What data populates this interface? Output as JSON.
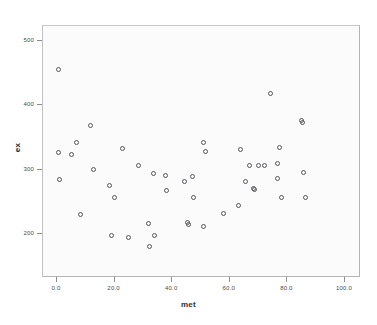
{
  "chart_data": {
    "type": "scatter",
    "title": "",
    "xlabel": "met",
    "ylabel": "ex",
    "xlim": [
      -5,
      105
    ],
    "ylim": [
      160,
      520
    ],
    "grid": false,
    "legend": null,
    "marker": "open-circle",
    "marker_color": "#55555c",
    "x_ticks": [
      0.0,
      20.0,
      40.0,
      60.0,
      80.0,
      100.0
    ],
    "x_tick_labels": [
      "0.0",
      "20.0",
      "40.0",
      "60.0",
      "80.0",
      "100.0"
    ],
    "y_ticks": [
      200,
      300,
      400,
      500
    ],
    "y_tick_labels": [
      "200",
      "300",
      "400",
      "500"
    ],
    "n_points": 55,
    "points": [
      {
        "x": 0.4,
        "y": 455
      },
      {
        "x": 0.6,
        "y": 327
      },
      {
        "x": 0.8,
        "y": 284
      },
      {
        "x": 5.2,
        "y": 323
      },
      {
        "x": 6.9,
        "y": 343
      },
      {
        "x": 8.0,
        "y": 230
      },
      {
        "x": 11.8,
        "y": 369
      },
      {
        "x": 12.5,
        "y": 301
      },
      {
        "x": 18.2,
        "y": 276
      },
      {
        "x": 18.9,
        "y": 198
      },
      {
        "x": 20.1,
        "y": 256
      },
      {
        "x": 22.9,
        "y": 333
      },
      {
        "x": 24.7,
        "y": 195
      },
      {
        "x": 28.3,
        "y": 307
      },
      {
        "x": 31.6,
        "y": 216
      },
      {
        "x": 32.0,
        "y": 181
      },
      {
        "x": 33.4,
        "y": 294
      },
      {
        "x": 34.0,
        "y": 197
      },
      {
        "x": 37.6,
        "y": 291
      },
      {
        "x": 37.9,
        "y": 268
      },
      {
        "x": 44.1,
        "y": 281
      },
      {
        "x": 45.3,
        "y": 218
      },
      {
        "x": 45.8,
        "y": 215
      },
      {
        "x": 46.9,
        "y": 289
      },
      {
        "x": 47.4,
        "y": 256
      },
      {
        "x": 50.7,
        "y": 212
      },
      {
        "x": 51.0,
        "y": 342
      },
      {
        "x": 51.6,
        "y": 328
      },
      {
        "x": 57.8,
        "y": 232
      },
      {
        "x": 62.9,
        "y": 245
      },
      {
        "x": 63.6,
        "y": 332
      },
      {
        "x": 65.5,
        "y": 282
      },
      {
        "x": 66.9,
        "y": 306
      },
      {
        "x": 68.3,
        "y": 271
      },
      {
        "x": 68.6,
        "y": 269
      },
      {
        "x": 70.1,
        "y": 307
      },
      {
        "x": 71.9,
        "y": 306
      },
      {
        "x": 74.1,
        "y": 419
      },
      {
        "x": 76.5,
        "y": 310
      },
      {
        "x": 76.7,
        "y": 286
      },
      {
        "x": 77.4,
        "y": 334
      },
      {
        "x": 78.1,
        "y": 257
      },
      {
        "x": 84.9,
        "y": 377
      },
      {
        "x": 85.3,
        "y": 373
      },
      {
        "x": 85.6,
        "y": 295
      },
      {
        "x": 86.2,
        "y": 256
      }
    ]
  },
  "axis": {
    "x_title": "met",
    "y_title": "ex"
  }
}
